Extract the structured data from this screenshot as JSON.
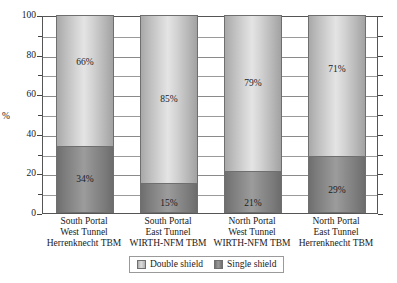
{
  "chart_data": {
    "type": "bar",
    "stacked": true,
    "stacked_mode": "percent",
    "title": "",
    "xlabel": "",
    "ylabel": "%",
    "ylim": [
      0,
      100
    ],
    "ytick_values": [
      0,
      20,
      40,
      60,
      80,
      100
    ],
    "ytick_labels": [
      "0",
      "20",
      "40",
      "60",
      "80",
      "100"
    ],
    "minor_tick_step": 10,
    "grid": true,
    "grid_axis": "y",
    "legend_position": "bottom-center",
    "categories": [
      "South Portal West Tunnel Herrenknecht TBM",
      "South Portal East Tunnel WIRTH-NFM TBM",
      "North Portal West Tunnel WIRTH-NFM TBM",
      "North Portal East Tunnel Herrenknecht TBM"
    ],
    "category_lines": [
      [
        "South Portal",
        "West Tunnel",
        "Herrenknecht TBM"
      ],
      [
        "South Portal",
        "East Tunnel",
        "WIRTH-NFM TBM"
      ],
      [
        "North Portal",
        "West Tunnel",
        "WIRTH-NFM TBM"
      ],
      [
        "North Portal",
        "East Tunnel",
        "Herrenknecht TBM"
      ]
    ],
    "series": [
      {
        "name": "Double shield",
        "values": [
          66,
          85,
          79,
          71
        ],
        "labels": [
          "66%",
          "85%",
          "79%",
          "71%"
        ],
        "color": "#d6d6d6"
      },
      {
        "name": "Single shield",
        "values": [
          34,
          15,
          21,
          29
        ],
        "labels": [
          "34%",
          "15%",
          "21%",
          "29%"
        ],
        "color": "#8c8c8c"
      }
    ]
  },
  "legend": {
    "items": [
      {
        "label": "Double shield",
        "swatch": "legend-swatch-double-shield"
      },
      {
        "label": "Single shield",
        "swatch": "legend-swatch-single-shield"
      }
    ]
  },
  "axis": {
    "y_title": "%"
  }
}
